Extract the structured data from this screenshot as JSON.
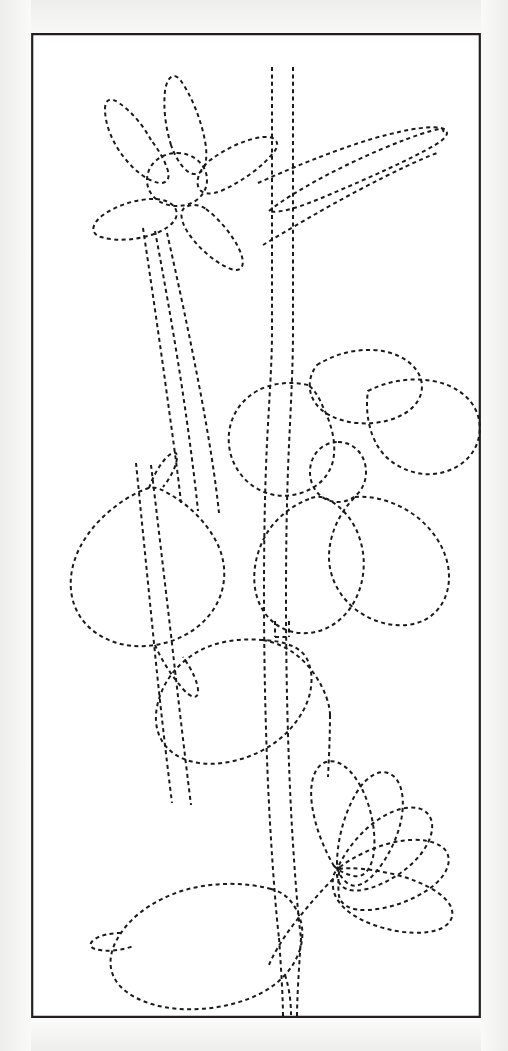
{
  "document": {
    "title": "Floral Quilting Stitch Pattern Template",
    "background_color": "#f7f7f6",
    "paper_color": "#ffffff"
  },
  "frame": {
    "name": "pattern-border-rectangle",
    "x": 31,
    "y": 33,
    "width": 450,
    "height": 985,
    "stroke_color": "#231f20",
    "stroke_width": 2.2,
    "style": "solid"
  },
  "line_style": {
    "stroke_color": "#1a1a1a",
    "stroke_width": 2.0,
    "dash_array": "4 3.4",
    "linecap": "butt",
    "fill": "none",
    "description": "dashed stitch guide lines"
  },
  "motifs": [
    {
      "id": "top-flower",
      "label": "Five petal flower, upper left",
      "petal_count": 5,
      "has_center": true,
      "center": {
        "cx": 146,
        "cy": 146,
        "rx": 30,
        "ry": 26
      }
    },
    {
      "id": "upper-narrow-leaf",
      "label": "Long narrow pointed leaf, upper right",
      "petal_count": 1,
      "has_center": false
    },
    {
      "id": "middle-flower",
      "label": "Five petal flower, center right",
      "petal_count": 5,
      "has_center": true,
      "center": {
        "cx": 307,
        "cy": 439,
        "rx": 28,
        "ry": 30
      }
    },
    {
      "id": "left-leaf",
      "label": "Large pointed leaf, center left",
      "petal_count": 1,
      "has_center": false
    },
    {
      "id": "tulip-leaf",
      "label": "Curved tulip-like leaf below middle flower",
      "petal_count": 1,
      "has_center": false
    },
    {
      "id": "fan-flower",
      "label": "Five petal fan flower, lower right",
      "petal_count": 5,
      "has_center": false
    },
    {
      "id": "bottom-leaf",
      "label": "Large rounded leaf, bottom left",
      "petal_count": 1,
      "has_center": false
    },
    {
      "id": "stems",
      "label": "Double-line stems running the height of the panel",
      "petal_count": 0,
      "has_center": false
    }
  ],
  "paths": {
    "frame_rect": "M 1.2 1.2 L 448.8 1.2 L 448.8 983.8 L 1.2 983.8 Z",
    "top_petal_upper_left": "M 120 107 C 112 92 100 78 88 70 C 80 64 74 66 74 76 C 74 92 82 112 96 128 C 106 140 118 148 128 150 C 136 151 140 145 136 135 C 133 126 127 116 120 107 Z",
    "top_petal_upper_mid": "M 140 112 C 135 96 132 76 134 58 C 136 44 143 38 150 48 C 160 62 170 86 174 108 C 177 124 175 136 168 140 C 159 145 147 132 140 112 Z",
    "top_petal_right": "M 178 128 C 194 116 214 106 232 104 C 245 103 250 110 243 119 C 232 133 212 148 192 157 C 179 163 169 161 167 153 C 165 145 170 135 178 128 Z",
    "top_petal_lower_left": "M 122 166 C 106 166 86 172 72 182 C 60 191 59 201 70 204 C 86 209 110 207 128 199 C 141 193 148 185 145 177 C 142 170 134 166 122 166 Z",
    "top_petal_lower_right": "M 175 176 C 188 186 202 202 209 218 C 215 232 211 240 200 236 C 184 230 166 214 156 198 C 148 185 149 175 157 173 C 163 171 169 172 175 176 Z",
    "top_flower_center": "M 146 120 C 163 120 176 132 176 147 C 176 162 163 173 146 173 C 129 173 116 162 116 147 C 116 132 129 120 146 120 Z",
    "narrow_leaf_top": "M 227 150 C 256 137 300 118 344 105 C 380 95 404 92 413 96 C 419 99 416 105 404 112 C 380 126 340 144 300 161 C 270 174 248 181 238 178",
    "narrow_leaf_bottom": "M 238 178 C 246 171 266 158 294 143 C 330 124 372 106 400 98 C 410 95 414 96 412 99",
    "narrow_leaf_lower_edge": "M 232 212 C 255 198 292 176 330 156 C 362 139 390 126 406 120",
    "stem_main_left": "M 241 34 L 241 300 C 241 330 238 370 236 410 C 234 452 233 500 233 560 C 233 640 235 720 239 790 C 242 840 245 880 248 905",
    "stem_main_right": "M 262 34 L 262 300 C 262 330 260 370 258 412 C 256 455 255 505 255 565 C 255 645 257 725 261 795 C 264 845 267 882 270 905",
    "stem_bottom_left": "M 248 905 C 250 935 252 965 252 984",
    "stem_bottom_right": "M 270 905 C 268 935 266 965 266 984",
    "branch_a": "M 112 195 C 118 235 126 290 133 340 C 140 392 147 440 150 470",
    "branch_b": "M 124 198 C 132 240 142 296 150 348 C 158 400 164 448 167 478",
    "branch_c": "M 136 200 C 146 244 158 300 168 352 C 178 404 185 450 188 480",
    "midrib_left": "M 105 430 C 110 480 116 540 122 600 C 128 662 135 722 141 770",
    "midrib_right": "M 120 432 C 126 482 133 542 140 602 C 147 664 154 724 160 772",
    "left_leaf_outline": "M 118 455 C 102 460 84 472 70 486 C 52 504 42 524 40 544 C 38 566 46 584 60 596 C 76 610 100 616 124 612 C 150 608 172 594 184 574 C 196 554 196 530 186 510 C 176 490 158 472 140 462 C 132 457 124 453 118 455 Z",
    "left_leaf_top_tip": "M 118 455 C 122 444 128 432 136 424 C 142 418 146 418 146 424 C 146 432 140 444 132 454",
    "left_leaf_bottom_tip": "M 124 612 C 130 626 140 642 152 656 C 160 665 166 666 167 660 C 168 652 162 638 152 624",
    "mid_petal_top": "M 286 332 C 302 322 322 316 342 317 C 362 318 378 326 386 338 C 394 350 392 364 382 374 C 370 386 348 392 326 390 C 306 388 290 380 283 368 C 276 356 278 342 286 332 Z",
    "mid_petal_right_upper": "M 337 358 C 356 348 380 344 402 348 C 424 352 440 364 446 380 C 452 396 448 414 436 426 C 424 438 404 444 386 440 C 368 436 354 426 346 412 C 338 398 334 378 337 358 Z",
    "mid_petal_left": "M 277 352 C 260 348 240 350 226 358 C 210 367 200 382 198 400 C 196 420 204 438 218 450 C 232 462 252 466 270 460 C 286 455 298 444 302 428 C 306 410 300 390 292 374 C 288 364 283 356 277 352 Z",
    "mid_petal_bottom_left": "M 278 466 C 262 472 246 484 236 500 C 224 520 220 544 226 564 C 232 584 248 598 268 600 C 288 602 308 592 320 574 C 332 556 336 532 330 510 C 325 490 312 474 296 466 C 290 463 284 463 278 466 Z",
    "mid_petal_bottom_right": "M 324 464 C 344 462 368 470 386 484 C 406 500 418 522 418 544 C 418 566 406 584 386 590 C 366 596 342 590 324 576 C 308 563 298 544 298 524 C 298 502 308 480 324 464 Z",
    "mid_flower_center": "M 307 409 C 323 409 335 422 335 439 C 335 456 323 469 307 469 C 291 469 279 456 279 439 C 279 422 291 409 307 409 Z",
    "calyx_left": "M 244 588 L 244 604",
    "calyx_right": "M 258 588 L 258 604",
    "calyx_bar": "M 244 604 L 258 604",
    "tulip_leaf_outline": "M 232 607 C 210 605 186 608 168 618 C 148 629 134 646 128 666 C 121 688 126 708 142 720 C 158 732 184 734 210 726 C 238 718 260 700 272 678 C 282 660 283 640 276 626 C 270 614 253 608 232 607 Z",
    "tulip_leaf_inner": "M 232 607 C 254 611 272 624 284 642 C 294 657 299 672 299 682",
    "tulip_leaf_vein": "M 299 682 C 299 702 298 724 297 744",
    "fan_petal_1": "M 303 833 C 293 816 284 794 281 772 C 278 750 283 733 295 729 C 307 725 321 736 331 756 C 340 774 345 798 343 818 C 341 836 333 845 323 843 C 314 841 308 838 303 833 Z",
    "fan_petal_2": "M 306 831 C 306 812 311 788 321 768 C 331 747 345 736 357 740 C 369 744 374 761 371 782 C 368 803 357 825 344 840 C 333 853 322 856 315 849 C 309 843 306 838 306 831 Z",
    "fan_petal_3": "M 308 832 C 316 816 330 798 348 786 C 368 773 387 771 396 780 C 405 789 402 806 389 822 C 376 838 355 851 336 856 C 320 860 310 856 307 847 C 305 841 306 836 308 832 Z",
    "fan_petal_4": "M 309 834 C 322 824 342 814 364 809 C 388 804 408 808 415 818 C 422 829 415 844 398 856 C 381 868 357 876 337 877 C 320 878 310 872 308 863 C 307 855 307 843 309 834 Z",
    "fan_petal_5": "M 308 836 C 320 834 342 836 366 842 C 392 849 412 860 419 872 C 426 885 417 896 398 899 C 378 902 352 897 331 887 C 313 878 303 866 302 854 C 301 844 303 838 308 836 Z",
    "fan_stem": "M 302 846 C 290 858 276 874 262 892 C 250 908 242 922 238 932",
    "bottom_leaf_outline": "M 240 856 C 214 849 182 849 154 857 C 124 866 102 882 90 900 C 76 920 76 940 90 954 C 106 970 136 978 168 976 C 204 974 236 962 254 942 C 272 922 276 898 266 878 C 260 866 252 859 240 856 Z",
    "bottom_leaf_notch": "M 90 900 C 80 900 70 902 64 906 C 58 910 58 914 64 916 C 74 919 90 918 102 913",
    "bottom_leaf_tail": "M 254 942 C 258 954 260 968 260 982"
  }
}
